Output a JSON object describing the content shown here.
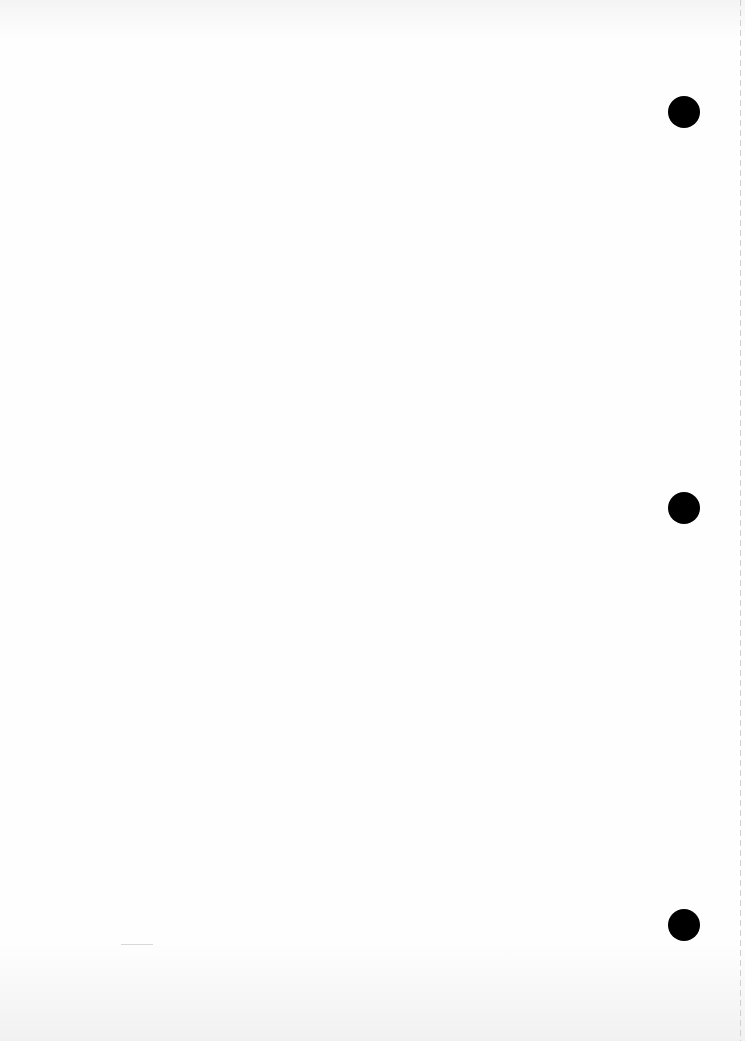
{
  "document": {
    "type": "blank scanned page",
    "punch_holes": [
      {
        "cx": 684,
        "cy": 112,
        "r": 16
      },
      {
        "cx": 684,
        "cy": 508,
        "r": 16
      },
      {
        "cx": 684,
        "cy": 925,
        "r": 16
      }
    ],
    "colors": {
      "paper": "#fefefe",
      "hole": "#000000",
      "edge_line": "#cfcfcf"
    }
  }
}
